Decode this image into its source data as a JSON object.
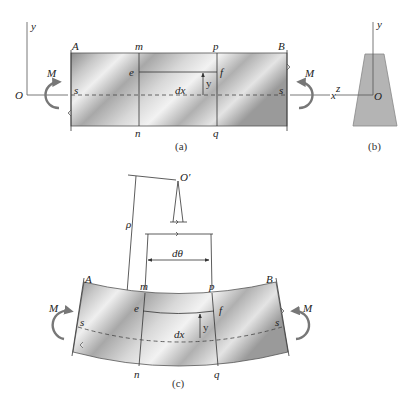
{
  "figure": {
    "panel_a": {
      "caption": "(a)",
      "labels": {
        "A": "A",
        "B": "B",
        "m": "m",
        "p": "p",
        "e": "e",
        "f": "f",
        "n": "n",
        "q": "q",
        "s_left": "s",
        "s_right": "s",
        "dx": "dx",
        "y_dim": "y",
        "M_left": "M",
        "M_right": "M",
        "O": "O",
        "y_axis": "y",
        "x_axis": "x"
      }
    },
    "panel_b": {
      "caption": "(b)",
      "labels": {
        "y_axis": "y",
        "z_axis": "z",
        "O": "O"
      }
    },
    "panel_c": {
      "caption": "(c)",
      "labels": {
        "O_prime": "O′",
        "rho": "ρ",
        "dtheta": "dθ",
        "A": "A",
        "B": "B",
        "m": "m",
        "p": "p",
        "e": "e",
        "f": "f",
        "n": "n",
        "q": "q",
        "s_left": "s",
        "s_right": "s",
        "dx": "dx",
        "y_dim": "y",
        "M_left": "M",
        "M_right": "M"
      }
    },
    "colors": {
      "beam_light": "#e8e8e8",
      "beam_dark": "#9a9a9a",
      "section_fill": "#b4b4b4",
      "line": "#333333",
      "moment_arrow": "#777777"
    }
  }
}
